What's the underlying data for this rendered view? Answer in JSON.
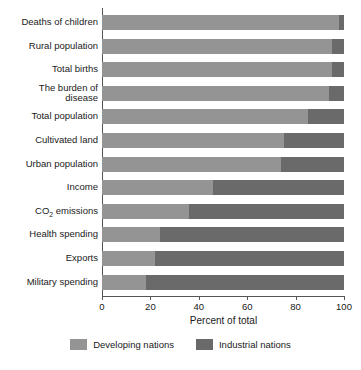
{
  "chart_data": {
    "type": "bar",
    "orientation": "horizontal",
    "stacked": true,
    "stack_mode": "percent",
    "title": "",
    "xlabel": "Percent of total",
    "ylabel": "",
    "xlim": [
      0,
      100
    ],
    "xticks": [
      0,
      20,
      40,
      60,
      80,
      100
    ],
    "xtick_labels": [
      "0",
      "20",
      "40",
      "60",
      "80",
      "100"
    ],
    "grid": false,
    "legend_position": "bottom",
    "categories": [
      "Deaths of children",
      "Rural population",
      "Total births",
      "The burden of disease",
      "Total population",
      "Cultivated land",
      "Urban population",
      "Income",
      "CO2 emissions",
      "Health spending",
      "Exports",
      "Military spending"
    ],
    "series": [
      {
        "name": "Developing nations",
        "color": "#949494",
        "values": [
          98,
          95,
          95,
          94,
          85,
          75,
          74,
          46,
          36,
          24,
          22,
          18
        ]
      },
      {
        "name": "Industrial nations",
        "color": "#6a6a6a",
        "values": [
          2,
          5,
          5,
          6,
          15,
          25,
          26,
          54,
          64,
          76,
          78,
          82
        ]
      }
    ]
  },
  "axis": {
    "x_title": "Percent of total",
    "x_tick_labels": [
      "0",
      "20",
      "40",
      "60",
      "80",
      "100"
    ]
  },
  "categories": [
    {
      "id": "deaths-of-children",
      "label": "Deaths of children",
      "html": "Deaths of children"
    },
    {
      "id": "rural-population",
      "label": "Rural population",
      "html": "Rural population"
    },
    {
      "id": "total-births",
      "label": "Total births",
      "html": "Total births"
    },
    {
      "id": "burden-of-disease",
      "label": "The burden of disease",
      "html": "The burden of<br>disease"
    },
    {
      "id": "total-population",
      "label": "Total population",
      "html": "Total population"
    },
    {
      "id": "cultivated-land",
      "label": "Cultivated land",
      "html": "Cultivated land"
    },
    {
      "id": "urban-population",
      "label": "Urban population",
      "html": "Urban population"
    },
    {
      "id": "income",
      "label": "Income",
      "html": "Income"
    },
    {
      "id": "co2-emissions",
      "label": "CO2 emissions",
      "html": "CO<sub>2</sub> emissions"
    },
    {
      "id": "health-spending",
      "label": "Health spending",
      "html": "Health spending"
    },
    {
      "id": "exports",
      "label": "Exports",
      "html": "Exports"
    },
    {
      "id": "military-spending",
      "label": "Military spending",
      "html": "Military spending"
    }
  ],
  "legend": {
    "items": [
      {
        "id": "developing-nations",
        "label": "Developing nations",
        "color": "#949494"
      },
      {
        "id": "industrial-nations",
        "label": "Industrial nations",
        "color": "#6a6a6a"
      }
    ]
  },
  "colors": {
    "developing": "#949494",
    "industrial": "#6a6a6a",
    "axis": "#555555",
    "text": "#1a1a1a",
    "background": "#ffffff"
  }
}
